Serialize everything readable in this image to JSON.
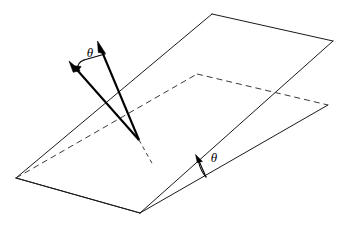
{
  "figure": {
    "background_color": "#ffffff",
    "line_color": "#1a1a1a",
    "hidden_line_color": "#3a3a3a",
    "vector_color": "#000000",
    "labels": {
      "vector_angle": "θ",
      "dihedral_angle": "θ"
    },
    "geometry": {
      "upper_plane": {
        "name": "upper-plane",
        "vertices": [
          [
            16,
            178
          ],
          [
            212,
            14
          ],
          [
            333,
            41
          ],
          [
            140,
            213
          ]
        ],
        "visible_edges": [
          [
            [
              16,
              178
            ],
            [
              212,
              14
            ]
          ],
          [
            [
              212,
              14
            ],
            [
              333,
              41
            ]
          ],
          [
            [
              333,
              41
            ],
            [
              140,
              213
            ]
          ],
          [
            [
              140,
              213
            ],
            [
              16,
              178
            ]
          ]
        ]
      },
      "lower_plane": {
        "name": "lower-plane",
        "vertices": [
          [
            16,
            178
          ],
          [
            197,
            74
          ],
          [
            328,
            105
          ],
          [
            140,
            213
          ]
        ],
        "hidden_edges": [
          [
            [
              16,
              178
            ],
            [
              197,
              74
            ]
          ],
          [
            [
              197,
              74
            ],
            [
              328,
              105
            ]
          ]
        ],
        "visible_edges": [
          [
            [
              328,
              105
            ],
            [
              140,
              213
            ]
          ],
          [
            [
              140,
              213
            ],
            [
              16,
              178
            ]
          ]
        ]
      },
      "fold_line": [
        [
          16,
          178
        ],
        [
          140,
          213
        ]
      ],
      "vectors": [
        {
          "name": "vector-left",
          "origin": [
            139,
            140
          ],
          "tip": [
            70,
            62
          ]
        },
        {
          "name": "vector-right",
          "origin": [
            139,
            140
          ],
          "tip": [
            98,
            42
          ]
        }
      ],
      "normal_stub_dashed": [
        [
          139,
          140
        ],
        [
          153,
          165
        ]
      ],
      "vector_angle_arc": {
        "center": [
          139,
          140
        ],
        "radius": 88,
        "from_vector": "vector-left",
        "to_vector": "vector-right",
        "label_position": [
          90,
          57
        ]
      },
      "dihedral_angle_mark": {
        "vertex": [
          205,
          176
        ],
        "arc_from": [
          196,
          155
        ],
        "label_position": [
          215,
          160
        ]
      }
    }
  }
}
